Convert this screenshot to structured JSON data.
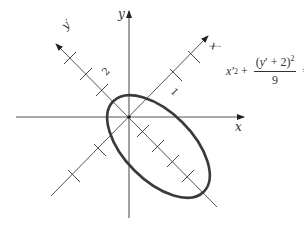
{
  "figure": {
    "axes": {
      "x_label": "x",
      "y_label": "y",
      "x_prime_label": "x′",
      "y_prime_label": "y′"
    },
    "tick_labels": {
      "y_prime_tick": "2",
      "x_prime_tick": "1"
    },
    "equation": {
      "term1_base": "x",
      "term1_prime": "′",
      "term1_exp": "2",
      "plus": "+",
      "numerator_open": "(",
      "numerator_var": "y",
      "numerator_prime": "′",
      "numerator_rest": " + 2)",
      "numerator_exp": "2",
      "denominator": "9",
      "equals": "=",
      "rhs": "1"
    },
    "ellipse": {
      "center_xprime": 0,
      "center_yprime": -2,
      "semi_axis_xprime": 1,
      "semi_axis_yprime": 3,
      "rotation_deg": 45,
      "stroke_color": "#3a3a3a"
    },
    "axis_color": "#555555"
  }
}
